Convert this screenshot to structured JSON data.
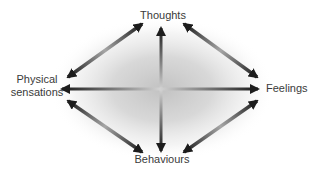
{
  "diagram": {
    "labels": {
      "top": "Thoughts",
      "left": "Physical sensations",
      "right": "Feelings",
      "bottom": "Behaviours"
    },
    "connections": [
      {
        "from": "Thoughts",
        "to": "Behaviours",
        "bidirectional": true
      },
      {
        "from": "Physical sensations",
        "to": "Feelings",
        "bidirectional": true
      },
      {
        "from": "Physical sensations",
        "to": "Thoughts",
        "bidirectional": true
      },
      {
        "from": "Thoughts",
        "to": "Feelings",
        "bidirectional": true
      },
      {
        "from": "Physical sensations",
        "to": "Behaviours",
        "bidirectional": true
      },
      {
        "from": "Behaviours",
        "to": "Feelings",
        "bidirectional": true
      }
    ],
    "colors": {
      "background": "#ffffff",
      "text": "#3a3a3a",
      "arrow_dark": "#1a1a1a",
      "arrow_light_axis": "#d2d2d2",
      "arrow_light_diagonal": "#a6a6a6",
      "glow": "#bdbdbd"
    }
  }
}
